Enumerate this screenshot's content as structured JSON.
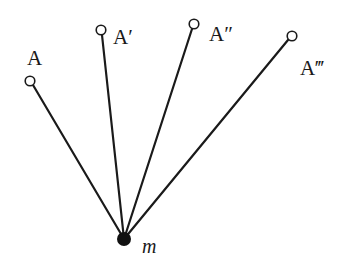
{
  "diagram": {
    "type": "pendulum-positions",
    "pivot": {
      "label": "m",
      "x": 124,
      "y": 239,
      "style": "filled-circle"
    },
    "points": [
      {
        "label": "A",
        "x": 30,
        "y": 81,
        "label_x": 27,
        "label_y": 58
      },
      {
        "label": "A′",
        "x": 101,
        "y": 30,
        "label_x": 114,
        "label_y": 44
      },
      {
        "label": "A″",
        "x": 194,
        "y": 24,
        "label_x": 210,
        "label_y": 40
      },
      {
        "label": "A‴",
        "x": 292,
        "y": 36,
        "label_x": 299,
        "label_y": 73
      }
    ],
    "colors": {
      "line": "#1a1a1a",
      "background": "#ffffff"
    }
  }
}
